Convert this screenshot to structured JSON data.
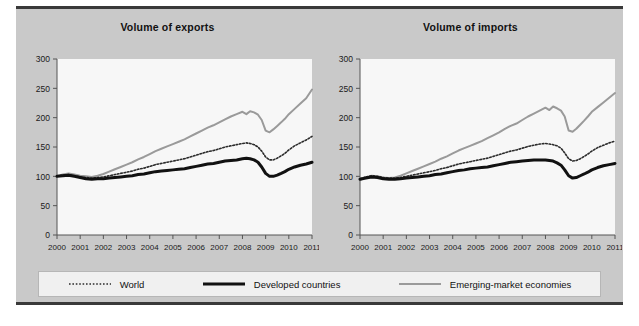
{
  "figure": {
    "background_color": "#c9c9c9",
    "plot_background_color": "#f7f7f7",
    "border_color": "#3a3a3a"
  },
  "legend": {
    "position": "bottom",
    "background_color": "#f0f0f0",
    "items": [
      {
        "label": "World",
        "style": "dotted",
        "color": "#2b2b2b",
        "width": 1.6
      },
      {
        "label": "Developed countries",
        "style": "solid",
        "color": "#111111",
        "width": 3.0
      },
      {
        "label": "Emerging-market economies",
        "style": "solid",
        "color": "#9a9a9a",
        "width": 2.0
      }
    ]
  },
  "chart_data": [
    {
      "type": "line",
      "title": "Volume of exports",
      "xlabel": "",
      "ylabel": "",
      "xlim": [
        2000,
        2011
      ],
      "ylim": [
        0,
        300
      ],
      "yticks": [
        0,
        50,
        100,
        150,
        200,
        250,
        300
      ],
      "xticks": [
        2000,
        2001,
        2002,
        2003,
        2004,
        2005,
        2006,
        2007,
        2008,
        2009,
        2010,
        2011
      ],
      "grid": false,
      "x": [
        2000.0,
        2000.25,
        2000.5,
        2000.75,
        2001.0,
        2001.25,
        2001.5,
        2001.75,
        2002.0,
        2002.25,
        2002.5,
        2002.75,
        2003.0,
        2003.25,
        2003.5,
        2003.75,
        2004.0,
        2004.25,
        2004.5,
        2004.75,
        2005.0,
        2005.25,
        2005.5,
        2005.75,
        2006.0,
        2006.25,
        2006.5,
        2006.75,
        2007.0,
        2007.25,
        2007.5,
        2007.75,
        2008.0,
        2008.17,
        2008.33,
        2008.5,
        2008.67,
        2008.83,
        2009.0,
        2009.17,
        2009.33,
        2009.5,
        2009.67,
        2009.83,
        2010.0,
        2010.25,
        2010.5,
        2010.75,
        2011.0
      ],
      "series": [
        {
          "name": "World",
          "color": "#2b2b2b",
          "style": "dotted",
          "width": 1.6,
          "values": [
            100,
            102,
            103,
            101,
            99,
            98,
            97,
            98,
            99,
            101,
            103,
            105,
            107,
            109,
            112,
            114,
            117,
            120,
            122,
            124,
            126,
            128,
            130,
            133,
            136,
            139,
            142,
            144,
            147,
            150,
            152,
            154,
            156,
            157,
            156,
            154,
            150,
            143,
            133,
            128,
            128,
            131,
            135,
            139,
            145,
            152,
            157,
            162,
            168
          ]
        },
        {
          "name": "Developed countries",
          "color": "#111111",
          "style": "solid",
          "width": 3.0,
          "values": [
            100,
            101,
            102,
            100,
            98,
            96,
            95,
            96,
            96,
            97,
            98,
            99,
            100,
            101,
            103,
            104,
            106,
            108,
            109,
            110,
            111,
            112,
            113,
            115,
            117,
            119,
            121,
            122,
            124,
            126,
            127,
            128,
            130,
            131,
            130,
            128,
            124,
            116,
            105,
            100,
            100,
            102,
            105,
            108,
            112,
            116,
            119,
            121,
            124
          ]
        },
        {
          "name": "Emerging-market economies",
          "color": "#9a9a9a",
          "style": "solid",
          "width": 2.0,
          "values": [
            100,
            103,
            105,
            103,
            101,
            100,
            99,
            101,
            104,
            108,
            112,
            116,
            120,
            124,
            129,
            133,
            138,
            143,
            147,
            151,
            155,
            159,
            163,
            168,
            173,
            178,
            183,
            187,
            192,
            197,
            202,
            206,
            210,
            206,
            211,
            209,
            205,
            196,
            178,
            175,
            180,
            186,
            192,
            198,
            206,
            215,
            224,
            233,
            248
          ]
        }
      ]
    },
    {
      "type": "line",
      "title": "Volume of imports",
      "xlabel": "",
      "ylabel": "",
      "xlim": [
        2000,
        2011
      ],
      "ylim": [
        0,
        300
      ],
      "yticks": [
        0,
        50,
        100,
        150,
        200,
        250,
        300
      ],
      "xticks": [
        2000,
        2001,
        2002,
        2003,
        2004,
        2005,
        2006,
        2007,
        2008,
        2009,
        2010,
        2011
      ],
      "grid": false,
      "x": [
        2000.0,
        2000.25,
        2000.5,
        2000.75,
        2001.0,
        2001.25,
        2001.5,
        2001.75,
        2002.0,
        2002.25,
        2002.5,
        2002.75,
        2003.0,
        2003.25,
        2003.5,
        2003.75,
        2004.0,
        2004.25,
        2004.5,
        2004.75,
        2005.0,
        2005.25,
        2005.5,
        2005.75,
        2006.0,
        2006.25,
        2006.5,
        2006.75,
        2007.0,
        2007.25,
        2007.5,
        2007.75,
        2008.0,
        2008.17,
        2008.33,
        2008.5,
        2008.67,
        2008.83,
        2009.0,
        2009.17,
        2009.33,
        2009.5,
        2009.67,
        2009.83,
        2010.0,
        2010.25,
        2010.5,
        2010.75,
        2011.0
      ],
      "series": [
        {
          "name": "World",
          "color": "#2b2b2b",
          "style": "dotted",
          "width": 1.6,
          "values": [
            96,
            99,
            101,
            100,
            98,
            97,
            97,
            98,
            100,
            102,
            104,
            106,
            108,
            110,
            113,
            115,
            118,
            121,
            123,
            125,
            127,
            129,
            131,
            134,
            137,
            140,
            143,
            145,
            148,
            151,
            153,
            155,
            156,
            155,
            154,
            152,
            148,
            140,
            130,
            126,
            127,
            130,
            134,
            138,
            143,
            149,
            153,
            157,
            160
          ]
        },
        {
          "name": "Developed countries",
          "color": "#111111",
          "style": "solid",
          "width": 3.0,
          "values": [
            95,
            97,
            99,
            98,
            96,
            95,
            95,
            96,
            97,
            98,
            99,
            100,
            101,
            103,
            104,
            106,
            108,
            110,
            111,
            113,
            114,
            115,
            116,
            118,
            120,
            122,
            124,
            125,
            126,
            127,
            128,
            128,
            128,
            127,
            126,
            123,
            119,
            111,
            101,
            97,
            98,
            101,
            104,
            107,
            111,
            115,
            118,
            120,
            122
          ]
        },
        {
          "name": "Emerging-market economies",
          "color": "#9a9a9a",
          "style": "solid",
          "width": 2.0,
          "values": [
            94,
            98,
            101,
            100,
            98,
            97,
            98,
            101,
            105,
            109,
            113,
            117,
            121,
            125,
            130,
            134,
            139,
            144,
            148,
            152,
            156,
            160,
            165,
            170,
            175,
            181,
            186,
            190,
            196,
            202,
            207,
            212,
            217,
            213,
            219,
            216,
            212,
            202,
            178,
            176,
            181,
            188,
            195,
            202,
            210,
            218,
            226,
            234,
            242
          ]
        }
      ]
    }
  ]
}
